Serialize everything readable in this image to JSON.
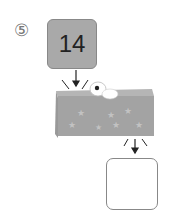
{
  "problem": {
    "label": "⑤",
    "input_value": "14",
    "output_value": ""
  },
  "colors": {
    "box_fill": "#a9a9a9",
    "machine_fill": "#a3a3a3",
    "machine_top": "#b5b5b5",
    "border": "#888888"
  }
}
